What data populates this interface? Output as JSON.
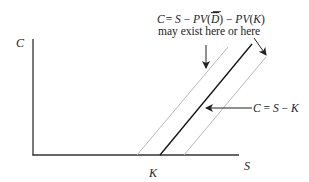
{
  "diagram": {
    "type": "call-option-bounds",
    "axes": {
      "y_label": "C",
      "x_label": "S",
      "x_tick_label": "K"
    },
    "annotations": {
      "top_formula": {
        "C": "C",
        "eq1": "= ",
        "S": "S",
        "minus1": " − ",
        "PV1": "PV",
        "open1": "(",
        "D": "D",
        "close1": ")",
        "minus2": " − ",
        "PV2": "PV",
        "open2": "(",
        "K": "K",
        "close2": ")"
      },
      "top_note": "may exist here or here",
      "mid_formula": {
        "C": "C",
        "eq": " = ",
        "S": "S",
        "minus": " − ",
        "K": "K"
      }
    },
    "lines": [
      {
        "name": "lower-bound-left",
        "style": "gray-thin",
        "color": "#b0b0b0"
      },
      {
        "name": "intrinsic-value",
        "style": "black-solid",
        "color": "#111111",
        "label": "C = S − K"
      },
      {
        "name": "lower-bound-right",
        "style": "gray-thin",
        "color": "#b0b0b0"
      }
    ],
    "colors": {
      "axis": "#333333",
      "main_line": "#111111",
      "alt_lines": "#b5b5b5",
      "text": "#222222"
    }
  }
}
